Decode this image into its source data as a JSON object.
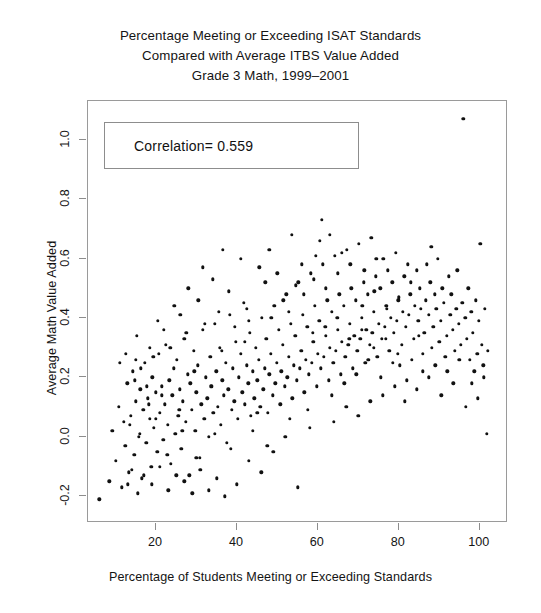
{
  "chart_data": {
    "type": "scatter",
    "title_lines": [
      "Percentage Meeting or Exceeding ISAT Standards",
      "Compared with Average ITBS Value Added",
      "Grade 3 Math, 1999–2001"
    ],
    "xlabel": "Percentage of Students Meeting or Exceeding Standards",
    "ylabel": "Average Math Value Added",
    "xlim": [
      3.2,
      107.0
    ],
    "ylim": [
      -0.29,
      1.13
    ],
    "xticks": [
      20,
      40,
      60,
      80,
      100
    ],
    "xtick_labels": [
      "20",
      "40",
      "60",
      "80",
      "100"
    ],
    "yticks": [
      -0.2,
      0.0,
      0.2,
      0.4,
      0.6,
      0.8,
      1.0
    ],
    "ytick_labels": [
      "-0.2",
      "0.0",
      "0.2",
      "0.4",
      "0.6",
      "0.8",
      "1.0"
    ],
    "grid": false,
    "legend": "none",
    "marker": "filled-circle",
    "marker_color": "#111111",
    "marker_size_px": 3.4,
    "annotations": [
      {
        "name": "correlation-box",
        "text": "Correlation= 0.559",
        "value": 0.559,
        "x_range": [
          8.0,
          70.0
        ],
        "y_range": [
          0.865,
          1.03
        ]
      }
    ],
    "n_points": 372,
    "points": [
      [
        6.0,
        -0.21
      ],
      [
        8.5,
        -0.15
      ],
      [
        9.2,
        0.02
      ],
      [
        10.1,
        -0.08
      ],
      [
        10.8,
        0.1
      ],
      [
        11.5,
        -0.17
      ],
      [
        12.0,
        0.05
      ],
      [
        12.4,
        -0.03
      ],
      [
        12.9,
        0.18
      ],
      [
        13.3,
        -0.12
      ],
      [
        13.8,
        0.07
      ],
      [
        14.2,
        0.22
      ],
      [
        14.6,
        -0.06
      ],
      [
        15.0,
        0.12
      ],
      [
        15.3,
        0.34
      ],
      [
        15.7,
        0.0
      ],
      [
        16.1,
        0.16
      ],
      [
        16.5,
        -0.14
      ],
      [
        16.9,
        0.09
      ],
      [
        17.2,
        0.25
      ],
      [
        17.6,
        -0.02
      ],
      [
        18.0,
        0.13
      ],
      [
        18.4,
        0.06
      ],
      [
        18.8,
        -0.1
      ],
      [
        19.1,
        0.2
      ],
      [
        19.5,
        0.03
      ],
      [
        19.9,
        0.15
      ],
      [
        20.3,
        -0.05
      ],
      [
        20.7,
        0.28
      ],
      [
        21.0,
        0.08
      ],
      [
        21.4,
        0.17
      ],
      [
        21.8,
        -0.01
      ],
      [
        22.2,
        0.11
      ],
      [
        22.5,
        0.31
      ],
      [
        22.9,
        0.04
      ],
      [
        23.3,
        0.19
      ],
      [
        23.7,
        -0.09
      ],
      [
        24.0,
        0.14
      ],
      [
        24.4,
        0.23
      ],
      [
        24.8,
        0.01
      ],
      [
        25.2,
        0.26
      ],
      [
        25.5,
        0.07
      ],
      [
        25.9,
        0.16
      ],
      [
        26.3,
        -0.04
      ],
      [
        26.7,
        0.12
      ],
      [
        27.0,
        0.33
      ],
      [
        27.4,
        0.05
      ],
      [
        27.8,
        0.21
      ],
      [
        28.2,
        -0.13
      ],
      [
        28.5,
        0.18
      ],
      [
        28.9,
        0.09
      ],
      [
        29.3,
        0.29
      ],
      [
        29.7,
        0.02
      ],
      [
        30.0,
        0.15
      ],
      [
        30.4,
        0.24
      ],
      [
        30.8,
        -0.07
      ],
      [
        31.2,
        0.11
      ],
      [
        31.5,
        0.36
      ],
      [
        31.9,
        0.06
      ],
      [
        32.3,
        0.2
      ],
      [
        32.7,
        0.13
      ],
      [
        33.0,
        0.0
      ],
      [
        33.4,
        0.27
      ],
      [
        33.8,
        0.17
      ],
      [
        34.2,
        0.08
      ],
      [
        34.5,
        0.38
      ],
      [
        34.9,
        0.22
      ],
      [
        35.3,
        0.1
      ],
      [
        35.7,
        0.3
      ],
      [
        36.0,
        0.04
      ],
      [
        36.4,
        0.19
      ],
      [
        36.8,
        0.14
      ],
      [
        37.2,
        0.25
      ],
      [
        37.5,
        -0.02
      ],
      [
        37.9,
        0.16
      ],
      [
        38.3,
        0.41
      ],
      [
        38.7,
        0.09
      ],
      [
        39.0,
        0.23
      ],
      [
        39.4,
        0.12
      ],
      [
        39.8,
        0.32
      ],
      [
        40.2,
        0.06
      ],
      [
        40.5,
        0.2
      ],
      [
        40.9,
        0.28
      ],
      [
        41.3,
        0.15
      ],
      [
        41.7,
        0.45
      ],
      [
        42.0,
        0.11
      ],
      [
        42.4,
        0.24
      ],
      [
        42.8,
        0.18
      ],
      [
        43.2,
        0.35
      ],
      [
        43.5,
        0.07
      ],
      [
        43.9,
        0.22
      ],
      [
        44.3,
        0.13
      ],
      [
        44.7,
        0.3
      ],
      [
        45.0,
        0.19
      ],
      [
        45.4,
        0.26
      ],
      [
        45.8,
        0.1
      ],
      [
        46.2,
        0.4
      ],
      [
        46.5,
        0.16
      ],
      [
        46.9,
        0.23
      ],
      [
        47.3,
        0.33
      ],
      [
        47.7,
        0.08
      ],
      [
        48.0,
        0.21
      ],
      [
        48.4,
        0.28
      ],
      [
        48.8,
        0.14
      ],
      [
        49.2,
        0.44
      ],
      [
        49.5,
        0.18
      ],
      [
        49.9,
        0.25
      ],
      [
        50.3,
        0.36
      ],
      [
        50.7,
        0.11
      ],
      [
        51.0,
        0.22
      ],
      [
        51.4,
        0.31
      ],
      [
        51.8,
        0.17
      ],
      [
        52.2,
        0.48
      ],
      [
        52.5,
        0.2
      ],
      [
        52.9,
        0.27
      ],
      [
        53.3,
        0.38
      ],
      [
        53.7,
        0.13
      ],
      [
        54.0,
        0.24
      ],
      [
        54.4,
        0.34
      ],
      [
        54.8,
        0.19
      ],
      [
        55.2,
        0.52
      ],
      [
        55.5,
        0.23
      ],
      [
        55.9,
        0.29
      ],
      [
        56.3,
        0.41
      ],
      [
        56.7,
        0.15
      ],
      [
        57.0,
        0.26
      ],
      [
        57.4,
        0.37
      ],
      [
        57.8,
        0.21
      ],
      [
        58.2,
        0.55
      ],
      [
        58.5,
        0.25
      ],
      [
        58.9,
        0.32
      ],
      [
        59.3,
        0.44
      ],
      [
        59.7,
        0.17
      ],
      [
        60.0,
        0.28
      ],
      [
        60.4,
        0.39
      ],
      [
        60.8,
        0.23
      ],
      [
        61.2,
        0.58
      ],
      [
        61.5,
        0.27
      ],
      [
        61.9,
        0.34
      ],
      [
        62.3,
        0.46
      ],
      [
        62.7,
        0.19
      ],
      [
        63.0,
        0.3
      ],
      [
        63.4,
        0.42
      ],
      [
        63.8,
        0.25
      ],
      [
        64.2,
        0.61
      ],
      [
        64.5,
        0.29
      ],
      [
        64.9,
        0.36
      ],
      [
        65.3,
        0.48
      ],
      [
        65.7,
        0.21
      ],
      [
        66.0,
        0.32
      ],
      [
        66.4,
        0.44
      ],
      [
        66.8,
        0.27
      ],
      [
        67.2,
        0.63
      ],
      [
        67.5,
        0.31
      ],
      [
        67.9,
        0.38
      ],
      [
        68.3,
        0.5
      ],
      [
        68.7,
        0.23
      ],
      [
        69.0,
        0.34
      ],
      [
        69.4,
        0.46
      ],
      [
        69.8,
        0.29
      ],
      [
        70.2,
        0.65
      ],
      [
        70.5,
        0.33
      ],
      [
        70.9,
        0.4
      ],
      [
        71.3,
        0.52
      ],
      [
        71.7,
        0.25
      ],
      [
        72.0,
        0.36
      ],
      [
        72.4,
        0.48
      ],
      [
        72.8,
        0.31
      ],
      [
        73.2,
        0.67
      ],
      [
        73.5,
        0.35
      ],
      [
        73.9,
        0.42
      ],
      [
        74.3,
        0.54
      ],
      [
        74.7,
        0.27
      ],
      [
        75.0,
        0.38
      ],
      [
        75.4,
        0.5
      ],
      [
        75.8,
        0.33
      ],
      [
        76.2,
        0.6
      ],
      [
        76.5,
        0.37
      ],
      [
        76.9,
        0.44
      ],
      [
        77.3,
        0.56
      ],
      [
        77.7,
        0.29
      ],
      [
        78.0,
        0.4
      ],
      [
        78.4,
        0.52
      ],
      [
        78.8,
        0.35
      ],
      [
        79.2,
        0.62
      ],
      [
        79.5,
        0.39
      ],
      [
        79.9,
        0.46
      ],
      [
        80.3,
        0.24
      ],
      [
        80.7,
        0.31
      ],
      [
        81.0,
        0.42
      ],
      [
        81.4,
        0.54
      ],
      [
        81.8,
        0.37
      ],
      [
        82.2,
        0.58
      ],
      [
        82.5,
        0.41
      ],
      [
        82.9,
        0.48
      ],
      [
        83.3,
        0.26
      ],
      [
        83.7,
        0.33
      ],
      [
        84.0,
        0.44
      ],
      [
        84.4,
        0.56
      ],
      [
        84.8,
        0.39
      ],
      [
        85.2,
        0.5
      ],
      [
        85.5,
        0.43
      ],
      [
        85.9,
        0.28
      ],
      [
        86.3,
        0.35
      ],
      [
        86.7,
        0.46
      ],
      [
        87.0,
        0.58
      ],
      [
        87.4,
        0.41
      ],
      [
        87.8,
        0.52
      ],
      [
        88.2,
        0.3
      ],
      [
        88.5,
        0.37
      ],
      [
        88.9,
        0.48
      ],
      [
        89.3,
        0.43
      ],
      [
        89.7,
        0.6
      ],
      [
        90.0,
        0.32
      ],
      [
        90.4,
        0.39
      ],
      [
        90.8,
        0.5
      ],
      [
        91.2,
        0.45
      ],
      [
        91.5,
        0.27
      ],
      [
        91.9,
        0.34
      ],
      [
        92.3,
        0.54
      ],
      [
        92.7,
        0.41
      ],
      [
        93.0,
        0.48
      ],
      [
        93.4,
        0.36
      ],
      [
        93.8,
        0.29
      ],
      [
        94.2,
        0.43
      ],
      [
        94.5,
        0.56
      ],
      [
        94.9,
        0.38
      ],
      [
        95.3,
        0.31
      ],
      [
        95.7,
        0.45
      ],
      [
        96.0,
        1.07
      ],
      [
        96.4,
        0.4
      ],
      [
        96.8,
        0.33
      ],
      [
        97.2,
        0.5
      ],
      [
        97.5,
        0.26
      ],
      [
        97.9,
        0.42
      ],
      [
        98.3,
        0.35
      ],
      [
        98.7,
        0.22
      ],
      [
        99.0,
        0.46
      ],
      [
        99.4,
        0.28
      ],
      [
        99.8,
        0.39
      ],
      [
        100.2,
        0.65
      ],
      [
        100.5,
        0.31
      ],
      [
        100.9,
        0.24
      ],
      [
        101.3,
        0.43
      ],
      [
        101.7,
        0.01
      ],
      [
        102.0,
        0.29
      ],
      [
        88.0,
        0.64
      ],
      [
        86.0,
        0.22
      ],
      [
        82.0,
        0.19
      ],
      [
        79.0,
        0.17
      ],
      [
        76.0,
        0.14
      ],
      [
        73.0,
        0.12
      ],
      [
        70.0,
        0.07
      ],
      [
        67.0,
        0.1
      ],
      [
        64.0,
        0.05
      ],
      [
        61.0,
        0.73
      ],
      [
        60.5,
        0.66
      ],
      [
        58.0,
        0.03
      ],
      [
        55.0,
        -0.17
      ],
      [
        52.0,
        0.0
      ],
      [
        49.0,
        -0.05
      ],
      [
        46.0,
        -0.12
      ],
      [
        43.0,
        -0.08
      ],
      [
        40.0,
        -0.16
      ],
      [
        37.0,
        -0.2
      ],
      [
        35.0,
        -0.14
      ],
      [
        33.0,
        -0.18
      ],
      [
        31.0,
        -0.11
      ],
      [
        29.0,
        -0.19
      ],
      [
        27.0,
        -0.15
      ],
      [
        25.0,
        -0.13
      ],
      [
        23.0,
        -0.18
      ],
      [
        21.0,
        -0.1
      ],
      [
        19.0,
        -0.16
      ],
      [
        17.0,
        -0.13
      ],
      [
        15.5,
        -0.19
      ],
      [
        14.0,
        -0.11
      ],
      [
        13.0,
        -0.16
      ],
      [
        36.5,
        0.63
      ],
      [
        31.5,
        0.57
      ],
      [
        28.0,
        0.5
      ],
      [
        34.0,
        0.53
      ],
      [
        41.0,
        0.6
      ],
      [
        45.5,
        0.57
      ],
      [
        50.0,
        0.55
      ],
      [
        54.5,
        0.51
      ],
      [
        24.5,
        0.44
      ],
      [
        20.5,
        0.39
      ],
      [
        18.5,
        0.3
      ],
      [
        22.0,
        0.36
      ],
      [
        26.0,
        0.41
      ],
      [
        30.5,
        0.46
      ],
      [
        38.0,
        0.49
      ],
      [
        42.5,
        0.43
      ],
      [
        47.0,
        0.52
      ],
      [
        51.5,
        0.46
      ],
      [
        56.5,
        0.48
      ],
      [
        59.0,
        0.53
      ],
      [
        62.0,
        0.5
      ],
      [
        65.0,
        0.55
      ],
      [
        68.0,
        0.58
      ],
      [
        71.0,
        0.44
      ],
      [
        74.0,
        0.49
      ],
      [
        77.0,
        0.43
      ],
      [
        80.0,
        0.47
      ],
      [
        83.0,
        0.52
      ],
      [
        85.0,
        0.34
      ],
      [
        44.0,
        0.02
      ],
      [
        47.5,
        -0.03
      ],
      [
        53.0,
        0.06
      ],
      [
        57.5,
        0.09
      ],
      [
        63.5,
        0.14
      ],
      [
        66.5,
        0.18
      ],
      [
        69.5,
        0.21
      ],
      [
        72.5,
        0.26
      ],
      [
        75.5,
        0.2
      ],
      [
        78.5,
        0.25
      ],
      [
        81.5,
        0.12
      ],
      [
        84.5,
        0.16
      ],
      [
        87.5,
        0.2
      ],
      [
        90.5,
        0.14
      ],
      [
        93.5,
        0.18
      ],
      [
        96.5,
        0.1
      ],
      [
        99.5,
        0.13
      ],
      [
        11.0,
        0.25
      ],
      [
        12.6,
        0.28
      ],
      [
        14.8,
        0.19
      ],
      [
        16.3,
        0.23
      ],
      [
        17.8,
        0.17
      ],
      [
        19.3,
        0.27
      ],
      [
        23.5,
        0.3
      ],
      [
        27.5,
        0.35
      ],
      [
        32.0,
        0.38
      ],
      [
        35.5,
        0.42
      ],
      [
        39.5,
        0.37
      ],
      [
        43.0,
        0.39
      ],
      [
        48.5,
        0.4
      ],
      [
        52.8,
        0.42
      ],
      [
        58.8,
        0.35
      ],
      [
        61.8,
        0.37
      ],
      [
        64.8,
        0.4
      ],
      [
        67.8,
        0.33
      ],
      [
        70.8,
        0.36
      ],
      [
        73.8,
        0.3
      ],
      [
        76.8,
        0.33
      ],
      [
        79.8,
        0.28
      ],
      [
        89.0,
        0.24
      ],
      [
        92.0,
        0.22
      ],
      [
        95.0,
        0.26
      ],
      [
        98.0,
        0.18
      ],
      [
        101.0,
        0.2
      ],
      [
        45.0,
        0.08
      ],
      [
        38.5,
        -0.04
      ],
      [
        34.5,
        0.01
      ],
      [
        30.0,
        -0.07
      ],
      [
        26.5,
        0.02
      ],
      [
        22.8,
        -0.06
      ],
      [
        20.0,
        0.06
      ],
      [
        16.0,
        0.01
      ],
      [
        13.5,
        0.04
      ],
      [
        59.5,
        0.61
      ],
      [
        56.0,
        0.58
      ],
      [
        48.0,
        0.63
      ],
      [
        53.5,
        0.68
      ],
      [
        63.0,
        0.68
      ],
      [
        66.0,
        0.62
      ],
      [
        71.5,
        0.56
      ],
      [
        74.5,
        0.6
      ],
      [
        33.5,
        0.17
      ],
      [
        36.2,
        0.29
      ],
      [
        29.5,
        0.22
      ],
      [
        25.8,
        0.09
      ],
      [
        21.5,
        0.14
      ],
      [
        18.2,
        0.11
      ],
      [
        15.0,
        0.26
      ],
      [
        42.0,
        0.32
      ]
    ]
  }
}
